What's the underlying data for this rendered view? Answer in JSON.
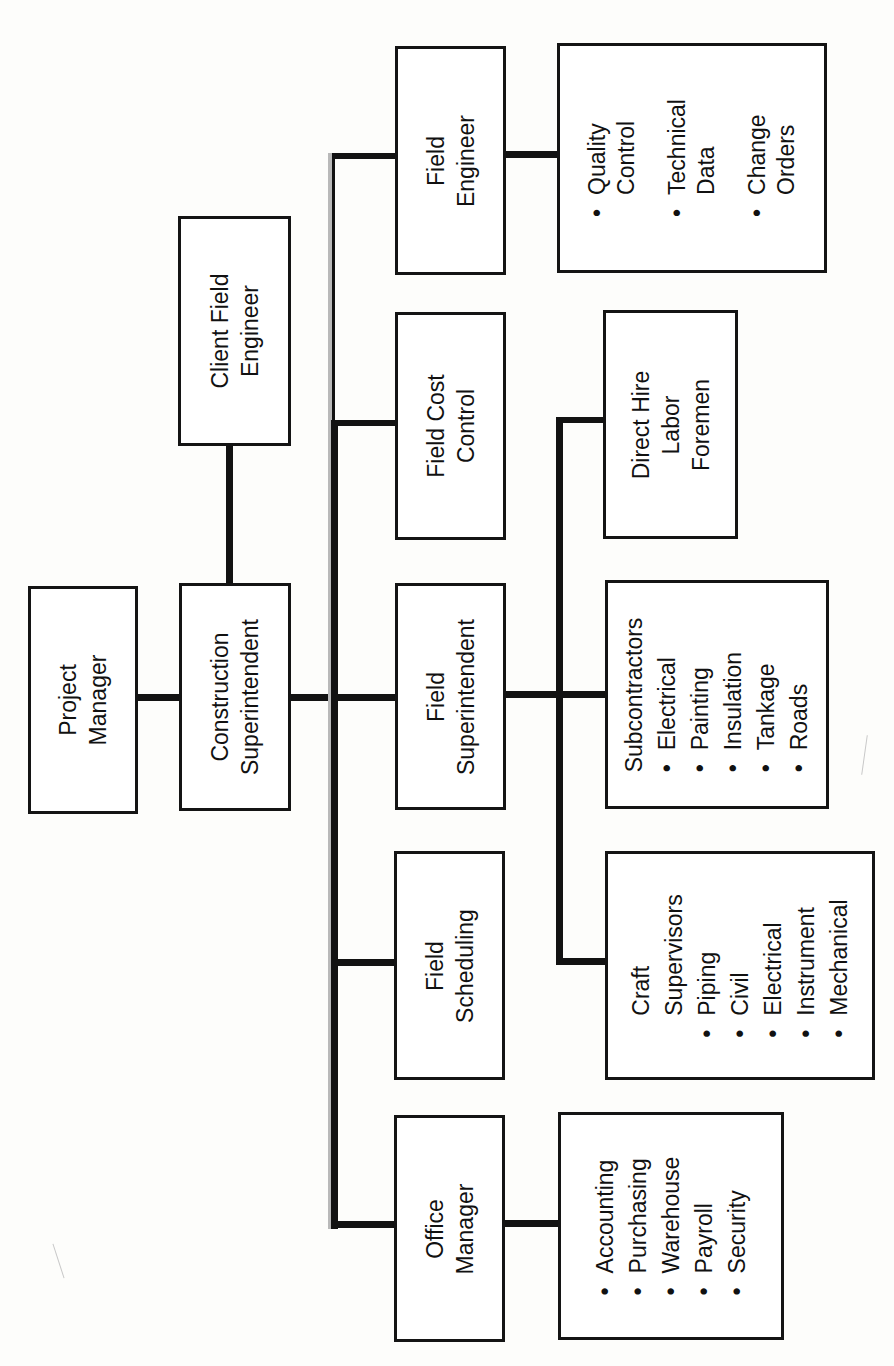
{
  "chart": {
    "nodes": {
      "project_manager": {
        "label_lines": [
          "Project",
          "Manager"
        ]
      },
      "construction_superintendent": {
        "label_lines": [
          "Construction",
          "Superintendent"
        ]
      },
      "client_field_engineer": {
        "label_lines": [
          "Client Field",
          "Engineer"
        ]
      },
      "field_engineer": {
        "label_lines": [
          "Field",
          "Engineer"
        ]
      },
      "field_cost_control": {
        "label_lines": [
          "Field Cost",
          "Control"
        ]
      },
      "field_superintendent": {
        "label_lines": [
          "Field",
          "Superintendent"
        ]
      },
      "field_scheduling": {
        "label_lines": [
          "Field",
          "Scheduling"
        ]
      },
      "office_manager": {
        "label_lines": [
          "Office",
          "Manager"
        ]
      },
      "field_engineer_duties": {
        "items": [
          {
            "bullet": "•",
            "lines": [
              "Quality",
              "Control"
            ]
          },
          {
            "bullet": "•",
            "lines": [
              "Technical",
              "Data"
            ]
          },
          {
            "bullet": "•",
            "lines": [
              "Change",
              "Orders"
            ]
          }
        ]
      },
      "direct_hire_labor_foremen": {
        "label_lines": [
          "Direct Hire",
          "Labor",
          "Foremen"
        ]
      },
      "subcontractors": {
        "title": "Subcontractors",
        "items": [
          {
            "bullet": "•",
            "label": "Electrical"
          },
          {
            "bullet": "•",
            "label": "Painting"
          },
          {
            "bullet": "•",
            "label": "Insulation"
          },
          {
            "bullet": "•",
            "label": "Tankage"
          },
          {
            "bullet": "•",
            "label": "Roads"
          }
        ]
      },
      "craft_supervisors": {
        "title_lines": [
          "Craft",
          "Supervisors"
        ],
        "items": [
          {
            "bullet": "•",
            "label": "Piping"
          },
          {
            "bullet": "•",
            "label": "Civil"
          },
          {
            "bullet": "•",
            "label": "Electrical"
          },
          {
            "bullet": "•",
            "label": "Instrument"
          },
          {
            "bullet": "•",
            "label": "Mechanical"
          }
        ]
      },
      "office_duties": {
        "items": [
          {
            "bullet": "•",
            "label": "Accounting"
          },
          {
            "bullet": "•",
            "label": "Purchasing"
          },
          {
            "bullet": "•",
            "label": "Warehouse"
          },
          {
            "bullet": "•",
            "label": "Payroll"
          },
          {
            "bullet": "•",
            "label": "Security"
          }
        ]
      }
    },
    "colors": {
      "line": "#121212",
      "box_border": "#141414",
      "spine_shadow": "#b9b9b9",
      "background": "#fdfdfb"
    }
  }
}
